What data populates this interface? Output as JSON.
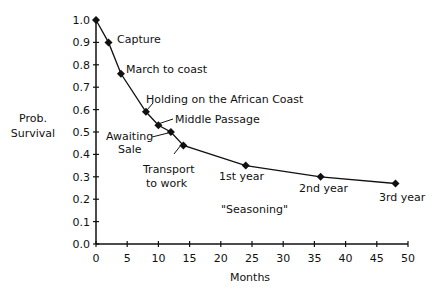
{
  "chart_data": {
    "type": "line",
    "title": "",
    "xlabel": "Months",
    "ylabel": "Prob. Survival",
    "xlim": [
      0,
      50
    ],
    "ylim": [
      0.0,
      1.0
    ],
    "grid": false,
    "legend": null,
    "x_ticks": [
      "0",
      "5",
      "10",
      "15",
      "20",
      "25",
      "30",
      "35",
      "40",
      "45",
      "50"
    ],
    "y_ticks": [
      "0.0",
      "0.1",
      "0.2",
      "0.3",
      "0.4",
      "0.5",
      "0.6",
      "0.7",
      "0.8",
      "0.9",
      "1.0"
    ],
    "series": [
      {
        "name": "Survival",
        "x": [
          0,
          2,
          4,
          8,
          10,
          12,
          14,
          24,
          36,
          48
        ],
        "values": [
          1.0,
          0.9,
          0.76,
          0.59,
          0.53,
          0.5,
          0.44,
          0.35,
          0.3,
          0.27
        ]
      }
    ],
    "annotations": [
      {
        "text": "Capture",
        "x": 2,
        "y": 0.9
      },
      {
        "text": "March to coast",
        "x": 4,
        "y": 0.76
      },
      {
        "text": "Holding on the African Coast",
        "x": 8,
        "y": 0.59
      },
      {
        "text": "Middle Passage",
        "x": 10,
        "y": 0.53
      },
      {
        "text": "Awaiting Sale",
        "x": 12,
        "y": 0.5
      },
      {
        "text": "Transport to work",
        "x": 14,
        "y": 0.44
      },
      {
        "text": "1st year",
        "x": 24,
        "y": 0.35
      },
      {
        "text": "2nd year",
        "x": 36,
        "y": 0.3
      },
      {
        "text": "3rd year",
        "x": 48,
        "y": 0.27
      },
      {
        "text": "\"Seasoning\"",
        "x": 27,
        "y": 0.16
      }
    ]
  },
  "labels": {
    "ylabel_line1": "Prob.",
    "ylabel_line2": "Survival",
    "xlabel": "Months",
    "capture": "Capture",
    "march": "March to coast",
    "holding": "Holding on the African Coast",
    "middle": "Middle Passage",
    "awaiting1": "Awaiting",
    "awaiting2": "Sale",
    "transport1": "Transport",
    "transport2": "to work",
    "year1": "1st year",
    "year2": "2nd year",
    "year3": "3rd year",
    "seasoning": "\"Seasoning\""
  }
}
